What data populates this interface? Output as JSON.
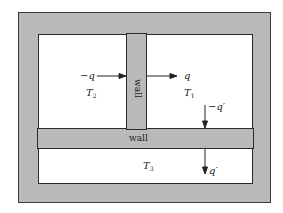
{
  "diagram": {
    "type": "heat-flow-through-walls",
    "colors": {
      "wall": "#b9b9b9",
      "room": "#ffffff",
      "line": "#2a2a2a"
    },
    "vertical_wall": {
      "label": "wall"
    },
    "horizontal_wall": {
      "label": "wall"
    },
    "rooms": [
      {
        "id": "left-top",
        "temperature": "T",
        "temperature_sub": "2",
        "flux": "−q"
      },
      {
        "id": "right-top",
        "temperature": "T",
        "temperature_sub": "1",
        "flux": "q"
      },
      {
        "id": "bottom",
        "temperature": "T",
        "temperature_sub": "3"
      }
    ],
    "fluxes": {
      "into_wall_left": "−q",
      "out_wall_right": "q",
      "into_horizontal_wall": "−q′",
      "out_horizontal_wall": "q′"
    }
  }
}
